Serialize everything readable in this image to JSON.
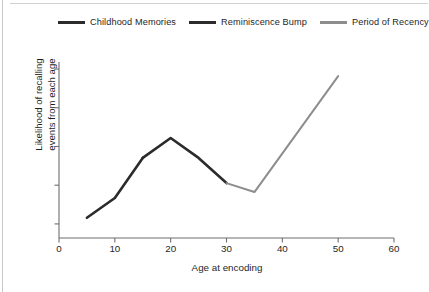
{
  "chart_data": {
    "type": "line",
    "title": "",
    "xlabel": "Age at encoding",
    "ylabel": "Likelihood of recalling events from each age",
    "ylabel_line1": "Likelihood of recalling",
    "ylabel_line2": "events from each age",
    "xlim": [
      0,
      60
    ],
    "ylim": [
      0,
      1
    ],
    "xticks": [
      0,
      10,
      20,
      30,
      40,
      50,
      60
    ],
    "xtick_labels": [
      "0",
      "10",
      "20",
      "30",
      "40",
      "50",
      "60"
    ],
    "yticks": [
      0.08,
      0.3,
      0.52,
      0.74,
      0.96
    ],
    "ytick_labels": [
      "",
      "",
      "",
      "",
      ""
    ],
    "grid": false,
    "legend_position": "top",
    "series": [
      {
        "name": "Childhood Memories",
        "color": "#2b2b2b",
        "x": [
          5,
          10,
          15
        ],
        "y": [
          0.115,
          0.227,
          0.455
        ]
      },
      {
        "name": "Reminiscence Bump",
        "color": "#2b2b2b",
        "x": [
          15,
          20,
          25,
          30
        ],
        "y": [
          0.455,
          0.568,
          0.455,
          0.312
        ]
      },
      {
        "name": "Period of Recency",
        "color": "#8d8d8d",
        "x": [
          30,
          35,
          50
        ],
        "y": [
          0.312,
          0.261,
          0.92
        ]
      }
    ],
    "annotations": []
  },
  "legend": {
    "items": [
      {
        "label": "Childhood Memories",
        "color": "#2b2b2b"
      },
      {
        "label": "Reminiscence Bump",
        "color": "#2b2b2b"
      },
      {
        "label": "Period of Recency",
        "color": "#8d8d8d"
      }
    ]
  },
  "colors": {
    "axis": "#6e6e6e",
    "text": "#1f1f1f",
    "dark_line": "#2b2b2b",
    "gray_line": "#8d8d8d",
    "background": "#ffffff"
  }
}
